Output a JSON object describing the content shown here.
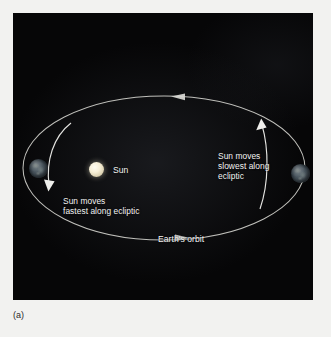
{
  "figure": {
    "caption": "(a)",
    "panel_background": "#060607",
    "page_background": "#f2f2f0",
    "text_color": "#f4f4f4",
    "orbit_stroke": "#d8d8d4"
  },
  "labels": {
    "sun": "Sun",
    "fastest": "Sun moves\nfastest along ecliptic",
    "slowest": "Sun moves\nslowest along\necliptic",
    "orbit": "Earth's orbit"
  },
  "bodies": {
    "sun": {
      "name": "Sun",
      "color": "#f7f0d8",
      "cx": 83.5,
      "cy": 156.5,
      "r": 7.5
    },
    "earth_left": {
      "name": "Earth",
      "color": "#47535c",
      "cx": 25.5,
      "cy": 155.5,
      "r": 9.5
    },
    "earth_right": {
      "name": "Earth",
      "color": "#47535c",
      "cx": 287.5,
      "cy": 160.5,
      "r": 9.5
    }
  },
  "orbit": {
    "shape": "ellipse",
    "cx": 151,
    "cy": 155,
    "rx": 141,
    "ry": 72,
    "direction": "counterclockwise",
    "arrowheads": [
      {
        "name": "top-arrow",
        "x": 165,
        "y": 84,
        "points": "left"
      },
      {
        "name": "bottom-arrow",
        "x": 168,
        "y": 224,
        "points": "right"
      }
    ]
  },
  "motion_arrows": [
    {
      "name": "perihelion-arrow",
      "side": "left",
      "points": "down-left"
    },
    {
      "name": "aphelion-arrow",
      "side": "right",
      "points": "up"
    }
  ]
}
